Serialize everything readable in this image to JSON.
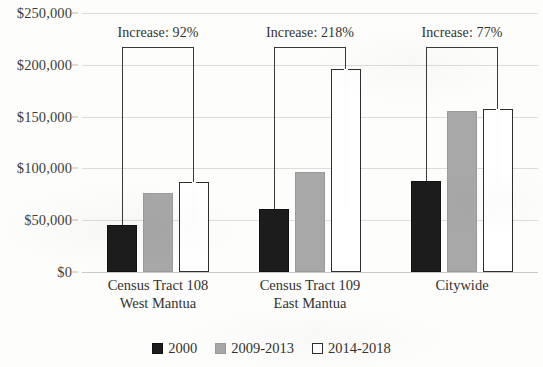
{
  "chart_data": {
    "type": "bar",
    "title": "",
    "subtitle": "",
    "xlabel": "",
    "ylabel": "",
    "categories": [
      "Census Tract 108\nWest Mantua",
      "Census Tract 109\nEast Mantua",
      "Citywide"
    ],
    "category_lines": [
      [
        "Census Tract 108",
        "West Mantua"
      ],
      [
        "Census Tract 109",
        "East Mantua"
      ],
      [
        "Citywide"
      ]
    ],
    "series": [
      {
        "name": "2000",
        "color": "#1c1c1c",
        "values": [
          45000,
          61000,
          88000
        ]
      },
      {
        "name": "2009-2013",
        "color": "#a8a8a8",
        "values": [
          76000,
          97000,
          155000
        ]
      },
      {
        "name": "2014-2018",
        "color": "#ffffff",
        "values": [
          87000,
          196000,
          157000
        ]
      }
    ],
    "annotations": [
      {
        "label": "Increase: 92%",
        "category_index": 0,
        "from_series": 0,
        "to_series": 2
      },
      {
        "label": "Increase: 218%",
        "category_index": 1,
        "from_series": 0,
        "to_series": 2
      },
      {
        "label": "Increase: 77%",
        "category_index": 2,
        "from_series": 0,
        "to_series": 2
      }
    ],
    "ylim": [
      0,
      250000
    ],
    "ytick_values": [
      0,
      50000,
      100000,
      150000,
      200000,
      250000
    ],
    "ytick_labels": [
      "$0",
      "$50,000",
      "$100,000",
      "$150,000",
      "$200,000",
      "$250,000"
    ],
    "grid": true,
    "legend_position": "bottom",
    "axis_color": "#dcdcdc",
    "text_color": "#333333"
  }
}
